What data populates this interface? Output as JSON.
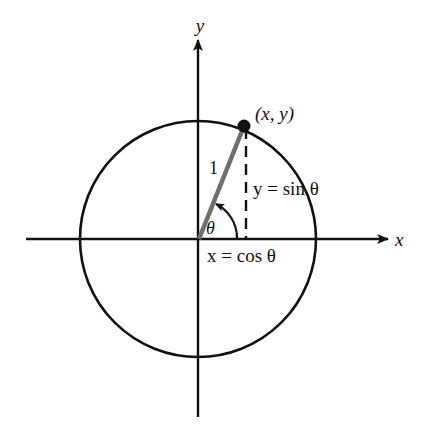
{
  "diagram": {
    "axes": {
      "x_label": "x",
      "y_label": "y"
    },
    "point_label": "(x, y)",
    "radius_label": "1",
    "angle_label": "θ",
    "vertical_label": "y = sin θ",
    "horizontal_label": "x = cos θ",
    "colors": {
      "stroke": "#111111",
      "radius": "#6e6e6e",
      "background": "#ffffff"
    }
  }
}
